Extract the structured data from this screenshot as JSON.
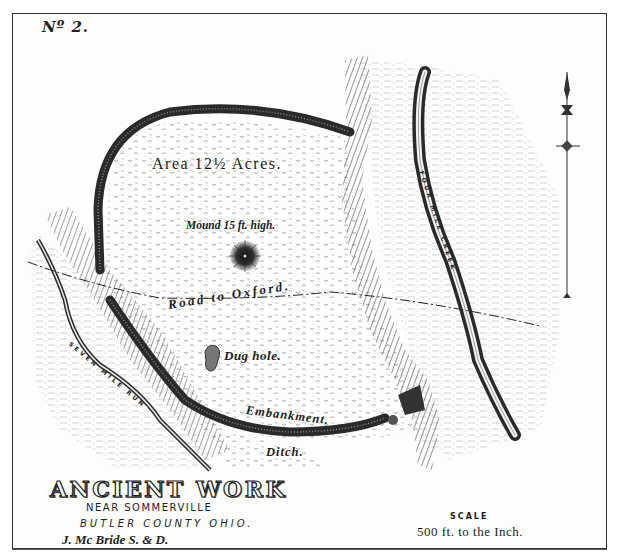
{
  "plate": {
    "number": "Nº 2."
  },
  "map": {
    "title": "ANCIENT WORK",
    "subtitle_near": "NEAR SOMMERVILLE",
    "subtitle_county": "BUTLER COUNTY OHIO.",
    "author": "J. Mc Bride S. & D.",
    "scale": {
      "title": "SCALE",
      "value": "500 ft. to the Inch."
    }
  },
  "labels": {
    "area": "Area 12½ Acres.",
    "mound": "Mound 15 ft. high.",
    "road": "Road to Oxford.",
    "dug_hole": "Dug hole.",
    "embankment": "Embankment.",
    "ditch": "Ditch.",
    "creek_right": "FOUR MILE CREEK",
    "creek_left": "SEVEN MILE RUN"
  },
  "features": {
    "north_arrow": "north-arrow",
    "colors": {
      "ink": "#1e1e1e",
      "paper": "#fdfdfc",
      "hatch": "#444444"
    }
  }
}
